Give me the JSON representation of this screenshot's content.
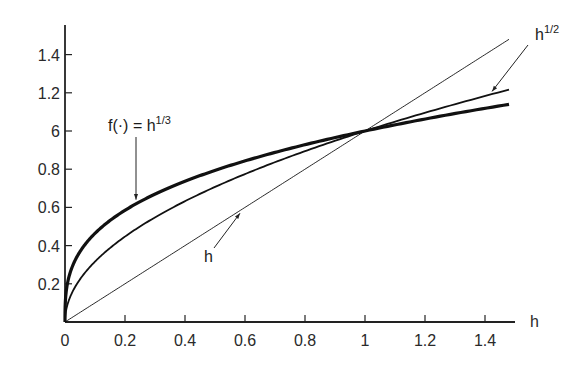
{
  "chart_data": {
    "type": "line",
    "title": "",
    "xlabel": "h",
    "ylabel": "",
    "xlim": [
      0,
      1.5
    ],
    "ylim": [
      0,
      1.5
    ],
    "grid": false,
    "legend": "none",
    "x_ticks": [
      {
        "value": 0,
        "label": "0"
      },
      {
        "value": 0.2,
        "label": "0.2"
      },
      {
        "value": 0.4,
        "label": "0.4"
      },
      {
        "value": 0.6,
        "label": "0.6"
      },
      {
        "value": 0.8,
        "label": "0.8"
      },
      {
        "value": 1.0,
        "label": "1"
      },
      {
        "value": 1.2,
        "label": "1.2"
      },
      {
        "value": 1.4,
        "label": "1.4"
      }
    ],
    "y_ticks": [
      {
        "value": 0.2,
        "label": "0.2"
      },
      {
        "value": 0.4,
        "label": "0.4"
      },
      {
        "value": 0.6,
        "label": "0.6"
      },
      {
        "value": 0.8,
        "label": "0.8"
      },
      {
        "value": 1.0,
        "label": "6"
      },
      {
        "value": 1.2,
        "label": "1.2"
      },
      {
        "value": 1.4,
        "label": "1.4"
      }
    ],
    "series": [
      {
        "name": "h^(1/3)",
        "exponent": 0.3333,
        "x_range": [
          0,
          1.48
        ],
        "style": "thick"
      },
      {
        "name": "h^(1/2)",
        "exponent": 0.5,
        "x_range": [
          0,
          1.48
        ],
        "style": "medium"
      },
      {
        "name": "h",
        "exponent": 1.0,
        "x_range": [
          0,
          1.48
        ],
        "style": "thin"
      }
    ],
    "annotations": [
      {
        "id": "cube-root",
        "text": "f(·) = h",
        "sup": "1/3",
        "target_x": 0.25
      },
      {
        "id": "sqrt",
        "text": "h",
        "sup": "1/2",
        "target_x": 1.42
      },
      {
        "id": "linear",
        "text": "h",
        "sup": "",
        "target_x": 0.58
      }
    ]
  }
}
